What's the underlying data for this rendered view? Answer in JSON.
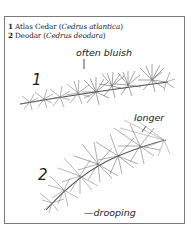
{
  "legend": [
    {
      "number": "1",
      "common_name": "Atlas Cedar",
      "open": " (",
      "latin": "Cedrus atlantica",
      "close": ")"
    },
    {
      "number": "2",
      "common_name": "Deodar",
      "open": " (",
      "latin": "Cedrus deodara",
      "close": ")"
    }
  ],
  "specimens": [
    {
      "number": "1",
      "annotation": "often bluish"
    },
    {
      "number": "2",
      "annotation_top": "longer",
      "annotation_bottom": "drooping",
      "annotation_bottom_dash": "—"
    }
  ],
  "colors": {
    "frame": "#7a7a7a",
    "needle": "#6e6e6e",
    "needle_dark": "#3a3a3a",
    "text": "#222222"
  }
}
